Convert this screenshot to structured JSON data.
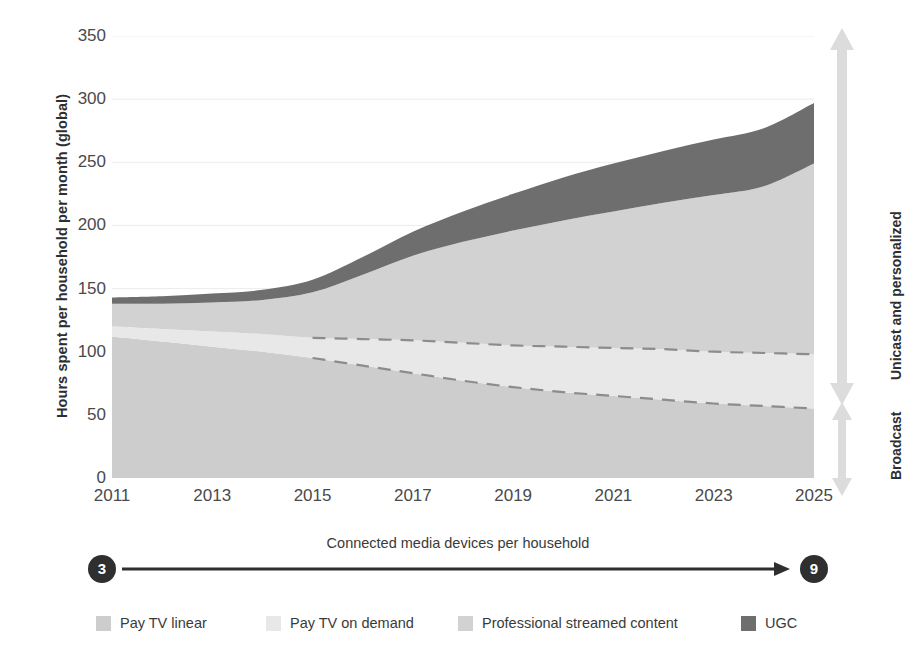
{
  "chart_data": {
    "type": "area",
    "title": "",
    "subtitle": "",
    "xlabel": "",
    "ylabel": "Hours spent per household per month (global)",
    "xlim": [
      2011,
      2025
    ],
    "ylim": [
      0,
      350
    ],
    "grid": true,
    "stacked": true,
    "legend_position": "bottom",
    "x": [
      2011,
      2012,
      2013,
      2014,
      2015,
      2016,
      2017,
      2018,
      2019,
      2020,
      2021,
      2022,
      2023,
      2024,
      2025
    ],
    "x_tick_labels": [
      "2011",
      "2013",
      "2015",
      "2017",
      "2019",
      "2021",
      "2023",
      "2025"
    ],
    "y_tick_labels": [
      "0",
      "50",
      "100",
      "150",
      "200",
      "250",
      "300",
      "350"
    ],
    "y_ticks": [
      0,
      50,
      100,
      150,
      200,
      250,
      300,
      350
    ],
    "series": [
      {
        "name": "Pay TV linear",
        "color": "#cdcdcd",
        "values": [
          112,
          108,
          104,
          100,
          95,
          89,
          83,
          77,
          72,
          68,
          65,
          62,
          59,
          57,
          55
        ]
      },
      {
        "name": "Pay TV on demand",
        "color": "#e8e8e8",
        "values": [
          8,
          10,
          12,
          14,
          16,
          21,
          26,
          30,
          33,
          36,
          38,
          40,
          41,
          42,
          43
        ]
      },
      {
        "name": "Professional streamed content",
        "color": "#d2d2d2",
        "values": [
          18,
          20,
          23,
          27,
          36,
          51,
          67,
          80,
          91,
          100,
          108,
          116,
          124,
          132,
          151
        ]
      },
      {
        "name": "UGC",
        "color": "#6e6e6e",
        "values": [
          5,
          6,
          7,
          8,
          10,
          14,
          19,
          24,
          29,
          34,
          38,
          41,
          44,
          46,
          48
        ]
      }
    ],
    "stack_totals": [
      143,
      144,
      146,
      149,
      157,
      175,
      195,
      211,
      225,
      238,
      249,
      259,
      268,
      277,
      297
    ],
    "annotations": {
      "dashed_boundaries_start_year": 2015,
      "dashed_boundary_upper": "top of Pay TV on demand",
      "dashed_boundary_lower": "top of Pay TV linear"
    }
  },
  "y_axis": {
    "title": "Hours spent per household per month (global)"
  },
  "side_annotations": {
    "upper_label": "Unicast and personalized",
    "lower_label": "Broadcast",
    "arrow_color": "#dcdcdc"
  },
  "device_annotation": {
    "caption": "Connected media devices per household",
    "start_value": "3",
    "end_value": "9"
  },
  "legend": {
    "items": [
      {
        "label": "Pay TV linear",
        "color": "#cdcdcd"
      },
      {
        "label": "Pay TV on demand",
        "color": "#e8e8e8"
      },
      {
        "label": "Professional streamed content",
        "color": "#d2d2d2"
      },
      {
        "label": "UGC",
        "color": "#6e6e6e"
      }
    ]
  },
  "colors": {
    "background": "#ffffff",
    "grid": "#ececec",
    "text": "#3a3a3a",
    "dashed_line": "#8c8c8c",
    "dark_accent": "#2f2f2f"
  }
}
